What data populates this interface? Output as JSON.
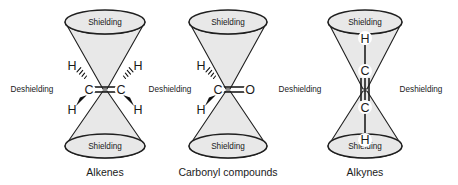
{
  "figure": {
    "background_color": "#ffffff",
    "line_color": "#1f1f1f",
    "cone_fill_color": "#e8e8e8",
    "text_color": "#1a1a1a"
  },
  "labels": {
    "shielding": "Shielding",
    "deshielding": "Deshielding"
  },
  "panels": [
    {
      "id": "alkenes",
      "caption": "Alkenes",
      "center_x": 105,
      "shielding_top": "Shielding",
      "shielding_bottom": "Shielding",
      "deshielding_left": "Deshielding",
      "deshielding_right": "Deshielding",
      "molecule": {
        "name": "ethene",
        "orientation": "horizontal",
        "bond_order": 2,
        "atoms": [
          "C",
          "C"
        ],
        "substituents": [
          {
            "label": "H",
            "position": "upper-left",
            "bond_style": "hashed-wedge"
          },
          {
            "label": "H",
            "position": "lower-left",
            "bond_style": "solid-wedge"
          },
          {
            "label": "H",
            "position": "upper-right",
            "bond_style": "hashed-wedge"
          },
          {
            "label": "H",
            "position": "lower-right",
            "bond_style": "solid-wedge"
          }
        ]
      }
    },
    {
      "id": "carbonyl",
      "caption": "Carbonyl compounds",
      "center_x": 228,
      "shielding_top": "Shielding",
      "shielding_bottom": "Shielding",
      "deshielding_left": "Deshielding",
      "deshielding_right": "Deshielding",
      "molecule": {
        "name": "formaldehyde",
        "orientation": "horizontal",
        "bond_order": 2,
        "atoms": [
          "C",
          "O"
        ],
        "substituents": [
          {
            "label": "H",
            "position": "upper-left",
            "bond_style": "hashed-wedge"
          },
          {
            "label": "H",
            "position": "lower-left",
            "bond_style": "solid-wedge"
          }
        ]
      }
    },
    {
      "id": "alkynes",
      "caption": "Alkynes",
      "center_x": 365,
      "shielding_top": "Shielding",
      "shielding_bottom": "Shielding",
      "deshielding_left": "Deshielding",
      "deshielding_right": "Deshielding",
      "molecule": {
        "name": "ethyne",
        "orientation": "vertical",
        "bond_order": 3,
        "atoms": [
          "H",
          "C",
          "C",
          "H"
        ],
        "substituents": []
      }
    }
  ],
  "deshielding_labels": [
    {
      "id": "deshielding-far-left",
      "text": "Deshielding",
      "x": 32,
      "y": 92
    },
    {
      "id": "deshielding-mid-left",
      "text": "Deshielding",
      "x": 170,
      "y": 92
    },
    {
      "id": "deshielding-mid-right",
      "text": "Deshielding",
      "x": 300,
      "y": 92
    },
    {
      "id": "deshielding-far-right",
      "text": "Deshielding",
      "x": 421,
      "y": 92
    }
  ]
}
